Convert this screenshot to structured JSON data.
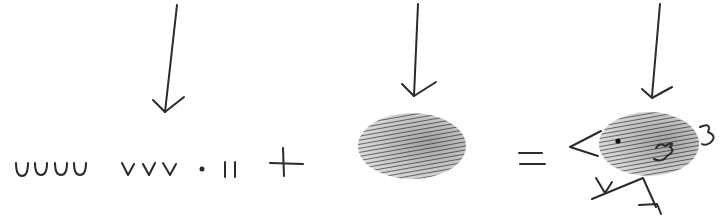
{
  "diagram": {
    "type": "thumbprint-art-equation",
    "steps": [
      {
        "id": "marks",
        "description": "pen marks: four U-shapes (feathers), three V-shapes (beak/feet), a dot (eye), two short strokes"
      },
      {
        "id": "operator-plus",
        "symbol": "+"
      },
      {
        "id": "thumbprint",
        "description": "inked thumbprint oval"
      },
      {
        "id": "operator-equals",
        "symbol": "="
      },
      {
        "id": "bird",
        "description": "thumbprint bird with beak, eye, wing, tail and feet"
      }
    ],
    "arrows": [
      {
        "points_to": "marks",
        "x": 165
      },
      {
        "points_to": "thumbprint",
        "x": 415
      },
      {
        "points_to": "bird",
        "x": 653
      }
    ],
    "colors": {
      "ink": "#2a2a2a",
      "print": "#6a6a6a",
      "background": "#ffffff"
    }
  }
}
